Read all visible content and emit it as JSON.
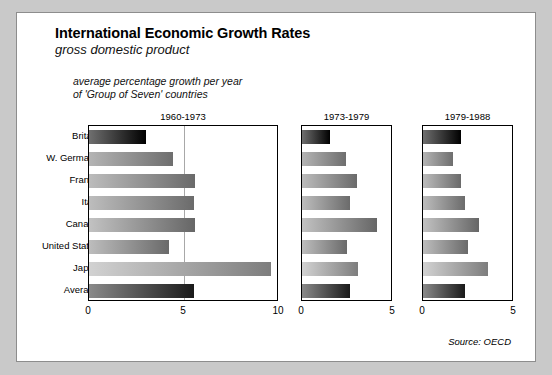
{
  "figure": {
    "title": "International Economic Growth Rates",
    "subtitle": "gross domestic product",
    "note_line1": "average percentage growth per year",
    "note_line2": "of 'Group of Seven' countries",
    "source": "Source: OECD"
  },
  "chart_data": {
    "type": "bar",
    "orientation": "horizontal",
    "title": "International Economic Growth Rates",
    "subtitle": "gross domestic product",
    "annotation": "average percentage growth per year of 'Group of Seven' countries",
    "source": "Source: OECD",
    "xlabel": "",
    "ylabel": "",
    "grid": true,
    "legend": "none",
    "categories": [
      "Britain",
      "W. Germany",
      "France",
      "Italy",
      "Canada",
      "United States",
      "Japan",
      "Average"
    ],
    "panels": [
      {
        "name": "1960-1973",
        "xlim": [
          0,
          10
        ],
        "xticks": [
          0,
          5,
          10
        ],
        "xticklabels": [
          "0",
          "5",
          "10"
        ],
        "values": [
          3.0,
          4.4,
          5.6,
          5.5,
          5.6,
          4.2,
          9.6,
          5.5
        ]
      },
      {
        "name": "1973-1979",
        "xlim": [
          0,
          5
        ],
        "xticks": [
          0,
          5
        ],
        "xticklabels": [
          "0",
          "5"
        ],
        "values": [
          1.55,
          2.4,
          3.0,
          2.65,
          4.1,
          2.45,
          3.1,
          2.65
        ]
      },
      {
        "name": "1979-1988",
        "xlim": [
          0,
          5
        ],
        "xticks": [
          0,
          5
        ],
        "xticklabels": [
          "0",
          "5"
        ],
        "values": [
          2.1,
          1.65,
          2.1,
          2.3,
          3.05,
          2.45,
          3.55,
          2.3
        ]
      }
    ],
    "bar_styles": {
      "Britain": {
        "from": "#6f6f6f",
        "to": "#000000"
      },
      "W. Germany": {
        "from": "#b4b4b4",
        "to": "#6e6e6e"
      },
      "France": {
        "from": "#bcbcbc",
        "to": "#6a6a6a"
      },
      "Italy": {
        "from": "#bdbdbd",
        "to": "#6b6b6b"
      },
      "Canada": {
        "from": "#c2c2c2",
        "to": "#666666"
      },
      "United States": {
        "from": "#bdbdbd",
        "to": "#6a6a6a"
      },
      "Japan": {
        "from": "#d2d2d2",
        "to": "#7d7d7d"
      },
      "Average": {
        "from": "#8a8a8a",
        "to": "#1a1a1a"
      }
    }
  }
}
